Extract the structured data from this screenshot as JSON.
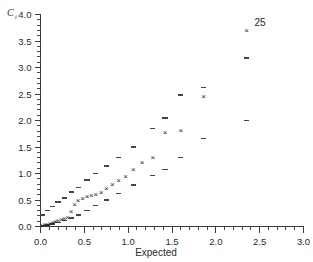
{
  "figure": {
    "width": 313,
    "height": 262,
    "background": "#ffffff",
    "ink_color": "#2b2b2b"
  },
  "chart_data": {
    "type": "scatter",
    "title": "",
    "subtitle": "",
    "xlabel": "Expected",
    "ylabel": "C",
    "ylabel_subscript": "i",
    "xlim": [
      0.0,
      3.0
    ],
    "ylim": [
      0.0,
      4.0
    ],
    "grid": false,
    "legend_position": "none",
    "xticks": [
      0.0,
      0.5,
      1.0,
      1.5,
      2.0,
      2.5,
      3.0
    ],
    "xticklabels": [
      "0.0",
      "0.5",
      "1.0",
      "1.5",
      "2.0",
      "2.5",
      "3.0"
    ],
    "xtick_minor_step": 0.1,
    "yticks": [
      0.0,
      0.5,
      1.0,
      1.5,
      2.0,
      2.5,
      3.0,
      3.5,
      4.0
    ],
    "yticklabels": [
      "0.0",
      "0.5",
      "1.0",
      "1.5",
      "2.0",
      "2.5",
      "3.0",
      "3.5",
      "4.0"
    ],
    "ytick_minor_step": 0.1,
    "series": [
      {
        "name": "Observed Cook's distance",
        "marker": "x",
        "color": "#1c1c1c",
        "x": [
          0.02,
          0.05,
          0.08,
          0.11,
          0.14,
          0.17,
          0.2,
          0.24,
          0.27,
          0.31,
          0.35,
          0.39,
          0.43,
          0.48,
          0.53,
          0.58,
          0.63,
          0.69,
          0.75,
          0.82,
          0.89,
          0.97,
          1.06,
          1.16,
          1.28,
          1.42,
          1.6,
          1.86,
          2.35
        ],
        "y": [
          0.02,
          0.04,
          0.05,
          0.07,
          0.09,
          0.1,
          0.12,
          0.14,
          0.16,
          0.18,
          0.3,
          0.42,
          0.5,
          0.53,
          0.57,
          0.6,
          0.62,
          0.66,
          0.72,
          0.8,
          0.88,
          0.95,
          1.08,
          1.22,
          1.32,
          1.78,
          1.82,
          2.46,
          3.7
        ]
      },
      {
        "name": "Simulated envelope upper",
        "marker": "dash",
        "color": "#444444",
        "x": [
          0.02,
          0.08,
          0.14,
          0.2,
          0.27,
          0.35,
          0.43,
          0.53,
          0.63,
          0.75,
          0.89,
          1.06,
          1.28,
          1.42,
          1.6,
          1.86,
          2.35
        ],
        "y": [
          0.22,
          0.3,
          0.38,
          0.46,
          0.54,
          0.65,
          0.74,
          0.88,
          1.0,
          1.14,
          1.3,
          1.5,
          1.85,
          2.05,
          2.48,
          2.62,
          3.18
        ]
      },
      {
        "name": "Simulated envelope lower",
        "marker": "dash",
        "color": "#444444",
        "x": [
          0.02,
          0.08,
          0.14,
          0.2,
          0.27,
          0.35,
          0.43,
          0.53,
          0.63,
          0.75,
          0.89,
          1.06,
          1.28,
          1.42,
          1.6,
          1.86,
          2.35
        ],
        "y": [
          0.01,
          0.03,
          0.05,
          0.08,
          0.11,
          0.16,
          0.22,
          0.3,
          0.4,
          0.5,
          0.62,
          0.78,
          0.96,
          1.08,
          1.3,
          1.66,
          2.0
        ]
      }
    ],
    "annotations": [
      {
        "text": "25",
        "x": 2.35,
        "y": 3.7,
        "dx_px": 8,
        "dy_px": -4
      }
    ]
  }
}
